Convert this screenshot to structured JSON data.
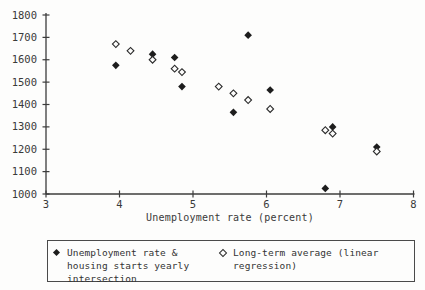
{
  "chart_data": {
    "type": "scatter",
    "title": "",
    "xlabel": "Unemployment rate (percent)",
    "ylabel": "",
    "xlim": [
      3,
      8
    ],
    "ylim": [
      1000,
      1800
    ],
    "x_ticks": [
      3,
      4,
      5,
      6,
      7,
      8
    ],
    "y_ticks": [
      1000,
      1100,
      1200,
      1300,
      1400,
      1500,
      1600,
      1700,
      1800
    ],
    "grid": false,
    "legend_position": "bottom",
    "series": [
      {
        "name": "Unemployment rate & housing starts yearly intersection",
        "marker": "filled-diamond",
        "points": [
          [
            3.95,
            1575
          ],
          [
            4.45,
            1625
          ],
          [
            4.75,
            1610
          ],
          [
            4.85,
            1480
          ],
          [
            5.55,
            1365
          ],
          [
            5.75,
            1710
          ],
          [
            6.05,
            1465
          ],
          [
            6.8,
            1025
          ],
          [
            6.9,
            1300
          ],
          [
            7.5,
            1210
          ]
        ]
      },
      {
        "name": "Long-term average (linear regression)",
        "marker": "open-diamond",
        "points": [
          [
            3.95,
            1670
          ],
          [
            4.15,
            1640
          ],
          [
            4.45,
            1600
          ],
          [
            4.75,
            1560
          ],
          [
            4.85,
            1545
          ],
          [
            5.35,
            1480
          ],
          [
            5.55,
            1450
          ],
          [
            5.75,
            1420
          ],
          [
            6.05,
            1380
          ],
          [
            6.8,
            1285
          ],
          [
            6.9,
            1270
          ],
          [
            7.5,
            1190
          ]
        ]
      }
    ]
  },
  "colors": {
    "ink": "#2e2e2e",
    "axis": "#3c3c3c",
    "background": "#fdfdfc"
  }
}
